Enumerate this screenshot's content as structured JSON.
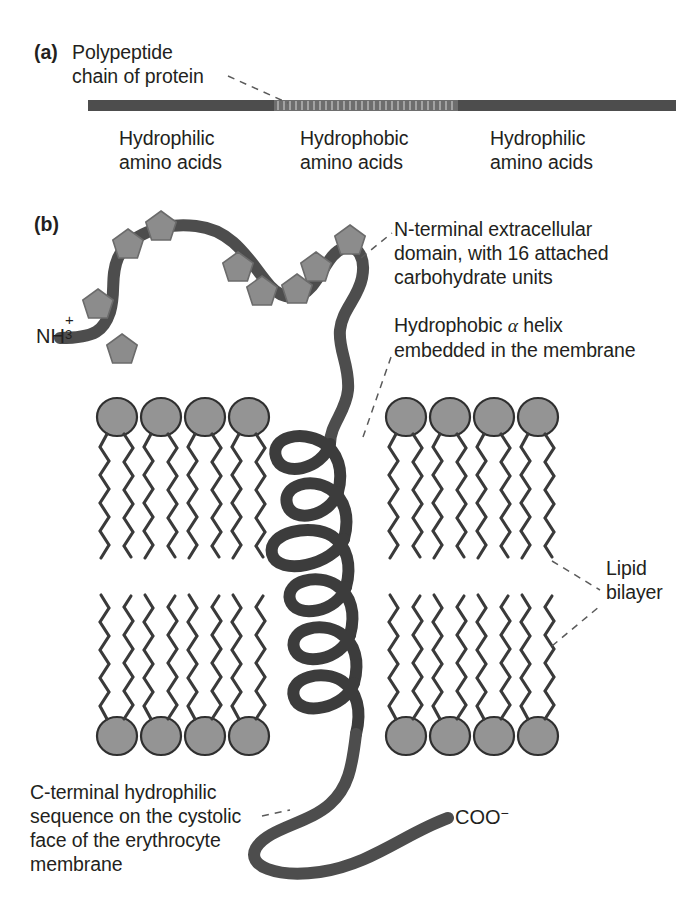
{
  "figure": {
    "type": "biology-diagram",
    "background_color": "#ffffff",
    "ink_color": "#231f20",
    "chain_color": "#4d4d4d",
    "carbohydrate_color": "#8c8c8c",
    "lipid_head_color": "#949494",
    "lipid_tail_color": "#3a3a3a"
  },
  "panel_a": {
    "tag": "(a)",
    "callout": "Polypeptide\nchain of protein",
    "bar": {
      "hydrophilic_color": "#4d4d4d",
      "hydrophobic_color": "#6e6e6e"
    },
    "segments": [
      {
        "label": "Hydrophilic\namino acids"
      },
      {
        "label": "Hydrophobic\namino acids"
      },
      {
        "label": "Hydrophilic\namino acids"
      }
    ]
  },
  "panel_b": {
    "tag": "(b)",
    "n_terminus": {
      "formula": "NH",
      "subscript": "3",
      "charge": "+"
    },
    "c_terminus": {
      "formula": "COO",
      "charge": "−"
    },
    "annotations": [
      {
        "name": "n-terminal-domain",
        "text": "N-terminal extracellular\ndomain, with 16 attached\ncarbohydrate units"
      },
      {
        "name": "hydrophobic-helix",
        "text_before": "Hydrophobic ",
        "alpha": "α",
        "text_after": " helix\nembedded in the membrane"
      },
      {
        "name": "lipid-bilayer",
        "text": "Lipid\nbilayer"
      },
      {
        "name": "c-terminal-sequence",
        "text": "C-terminal hydrophilic\nsequence on the cystolic\nface of the erythrocyte\nmembrane"
      }
    ],
    "counts": {
      "carbohydrate_units_stated": 16,
      "carbohydrate_pentagons_drawn": 9,
      "helix_turns_drawn": 6,
      "lipids_upper_left": 4,
      "lipids_upper_right": 4,
      "lipids_lower_left": 4,
      "lipids_lower_right": 4
    }
  }
}
